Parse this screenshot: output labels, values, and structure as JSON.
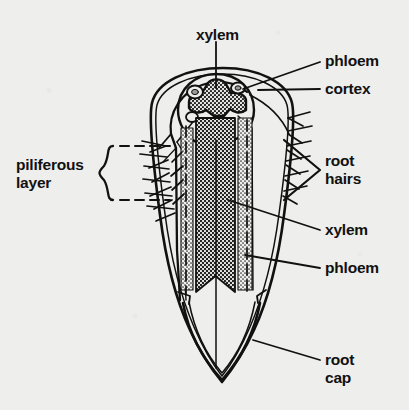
{
  "diagram": {
    "background_color": "#eeeeec",
    "ink_color": "#111111"
  },
  "labels": {
    "xylem_top": "xylem",
    "phloem_top": "phloem",
    "cortex": "cortex",
    "piliferous_layer_line1": "piliferous",
    "piliferous_layer_line2": "layer",
    "root_hairs_line1": "root",
    "root_hairs_line2": "hairs",
    "xylem_mid": "xylem",
    "phloem_mid": "phloem",
    "root_cap_line1": "root",
    "root_cap_line2": "cap"
  },
  "structures": {
    "root_outline": "root-body",
    "root_cap": "root-cap",
    "cortex_region": "cortex",
    "stele": "stele",
    "xylem_star": "xylem-star",
    "phloem_pockets": "phloem-pockets",
    "xylem_column": "xylem-column",
    "phloem_columns": "phloem-columns",
    "root_hairs_left": "root-hairs-left",
    "root_hairs_right": "root-hairs-right",
    "piliferous_bracket": "piliferous-brace",
    "piliferous_dashed_box": "piliferous-dashed-box",
    "root_hairs_bracket": "root-hairs-vee"
  }
}
